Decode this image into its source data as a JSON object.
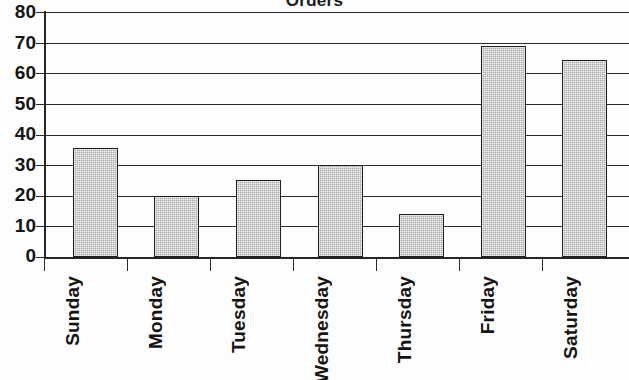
{
  "chart_data": {
    "type": "bar",
    "title": "Orders",
    "xlabel": "",
    "ylabel": "",
    "categories": [
      "Sunday",
      "Monday",
      "Tuesday",
      "Wednesday",
      "Thursday",
      "Friday",
      "Saturday"
    ],
    "values": [
      35.5,
      20,
      25,
      30,
      14,
      69,
      64.5
    ],
    "ylim": [
      0,
      80
    ],
    "ytick_labels": [
      "0",
      "10",
      "20",
      "30",
      "40",
      "50",
      "60",
      "70",
      "80"
    ],
    "ytick_values": [
      0,
      10,
      20,
      30,
      40,
      50,
      60,
      70,
      80
    ],
    "grid": "horizontal",
    "legend": "none",
    "bar_fill_color": "#a9a9a9",
    "bar_edge_color": "#1e1e1e",
    "axis_color": "#262626",
    "background_color": "#fdfdfd"
  },
  "axis": {
    "y_labels": [
      "80",
      "70",
      "60",
      "50",
      "40",
      "30",
      "20",
      "10",
      "0"
    ],
    "x_labels": [
      "Sunday",
      "Monday",
      "Tuesday",
      "Wednesday",
      "Thursday",
      "Friday",
      "Saturday"
    ]
  }
}
